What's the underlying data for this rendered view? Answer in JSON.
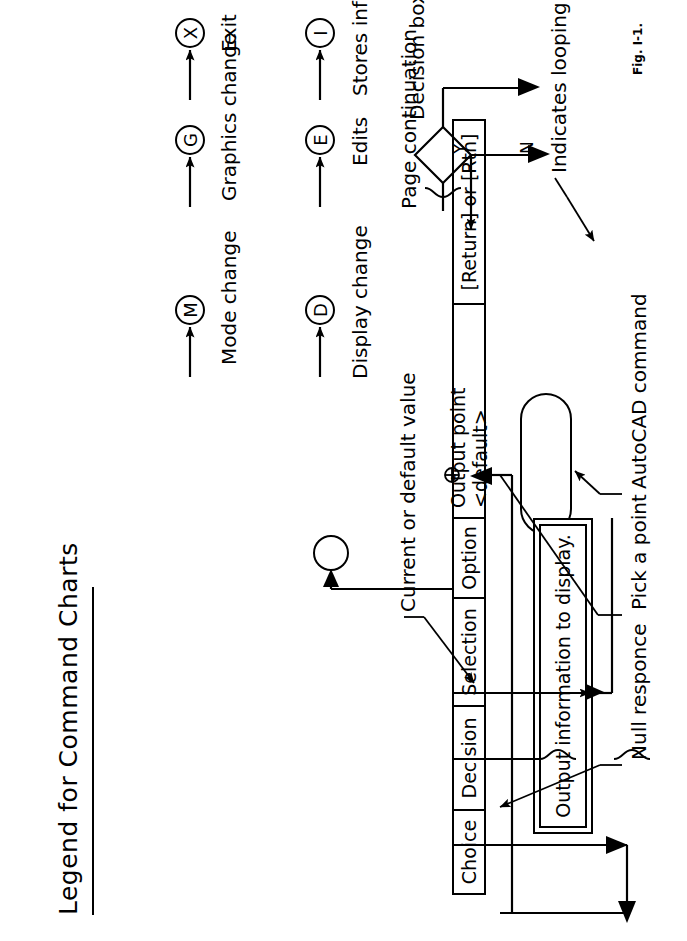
{
  "figure": {
    "title": "Legend for Command Charts",
    "caption": "Fig. I-1."
  },
  "band_cells": [
    {
      "label": "Choice"
    },
    {
      "label": "Decision"
    },
    {
      "label": "Selection"
    },
    {
      "label": "Option"
    },
    {
      "label": "Output point <default>"
    },
    {
      "label": "[Return] or [Rtn]"
    }
  ],
  "annotations": {
    "autocad_command": "AutoCAD command",
    "pick_a_point": "Pick a point",
    "null_responce": "Null responce",
    "current_or_default": "Current or default value",
    "indicates_looping": "Indicates looping",
    "page_continuation": "Page continuation",
    "decision_box": "Decision box",
    "decision_yes": "Y",
    "decision_no": "N"
  },
  "output_box": {
    "text": "Output information to display."
  },
  "nodes": [
    {
      "glyph": "D",
      "label": "Display change"
    },
    {
      "glyph": "M",
      "label": "Mode change"
    },
    {
      "glyph": "E",
      "label": "Edits"
    },
    {
      "glyph": "G",
      "label": "Graphics change"
    },
    {
      "glyph": "I",
      "label": "Stores information"
    },
    {
      "glyph": "X",
      "label": "Exit"
    }
  ],
  "colors": {
    "ink": "#000000",
    "paper": "#ffffff"
  }
}
